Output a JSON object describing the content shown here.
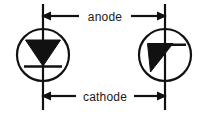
{
  "diagram": {
    "background_color": "#ffffff",
    "stroke_color": "#111111",
    "text_color": "#1a1a1a",
    "labels": {
      "anode": "anode",
      "cathode": "cathode"
    },
    "symbols": [
      {
        "name": "diode-symbol-standard",
        "type": "diode-in-circle",
        "orientation": "vertical",
        "center_x": 43,
        "center_y": 55,
        "radius": 26
      },
      {
        "name": "diode-symbol-rotated",
        "type": "diode-in-circle",
        "orientation": "rotated",
        "center_x": 165,
        "center_y": 55,
        "radius": 26
      }
    ],
    "annotations": [
      {
        "name": "anode-dimension",
        "label": "anode",
        "position": "top",
        "arrow_left_direction": "left",
        "arrow_right_direction": "right",
        "y": 16
      },
      {
        "name": "cathode-dimension",
        "label": "cathode",
        "position": "bottom",
        "arrow_left_direction": "left",
        "arrow_right_direction": "right",
        "y": 96
      }
    ]
  }
}
